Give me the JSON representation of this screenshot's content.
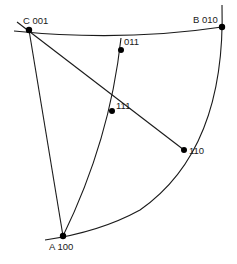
{
  "diagram": {
    "type": "stereographic-triangle",
    "points": {
      "A": {
        "name": "A",
        "index": "100",
        "label": "A 100"
      },
      "B": {
        "name": "B",
        "index": "010",
        "label": "B 010"
      },
      "C": {
        "name": "C",
        "index": "001",
        "label": "C 001"
      },
      "p011": {
        "index": "011",
        "label": "011"
      },
      "p111": {
        "index": "111",
        "label": "111"
      },
      "p110": {
        "index": "110",
        "label": "110"
      }
    },
    "colors": {
      "line": "#1a1a1a",
      "background": "#ffffff"
    }
  }
}
